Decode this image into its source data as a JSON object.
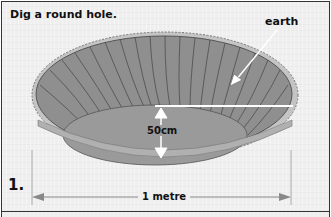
{
  "instruction": {
    "title": "Dig a round hole.",
    "step_number": "1."
  },
  "labels": {
    "earth": "earth",
    "depth": "50cm",
    "width": "1 metre"
  },
  "colors": {
    "hole_fill": "#8f8f8f",
    "floor_fill": "#9a9a9a",
    "rim_fill": "#c4c4c4",
    "background": "#efefef",
    "line": "#333333",
    "guide_line": "#ffffff"
  }
}
